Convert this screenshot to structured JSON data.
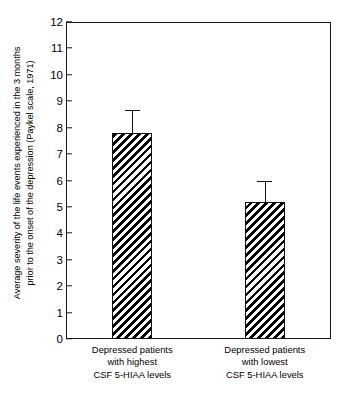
{
  "chart_data": {
    "type": "bar",
    "title": "",
    "subtitle": "",
    "xlabel": "",
    "ylabel_lines": [
      "Average severity of the life events experienced in the 3 months",
      "prior to the onset of the depression (Paykel scale, 1971)"
    ],
    "ylabel": "Average severity of the life events experienced in the 3 months prior to the onset of the depression (Paykel scale, 1971)",
    "categories": [
      "Depressed patients with highest CSF 5-HIAA levels",
      "Depressed patients with lowest CSF 5-HIAA levels"
    ],
    "category_lines": [
      [
        "Depressed patients",
        "with highest",
        "CSF 5-HIAA levels"
      ],
      [
        "Depressed patients",
        "with lowest",
        "CSF 5-HIAA levels"
      ]
    ],
    "values": [
      7.8,
      5.2
    ],
    "errors": [
      0.85,
      0.8
    ],
    "error_type": "upper-only",
    "ylim": [
      0,
      12
    ],
    "ytick_step": 1,
    "ytick_labels": [
      "12",
      "11",
      "10",
      "9",
      "8",
      "7",
      "6",
      "5",
      "4",
      "3",
      "2",
      "1",
      "0"
    ],
    "ytick_values": [
      12,
      11,
      10,
      9,
      8,
      7,
      6,
      5,
      4,
      3,
      2,
      1,
      0
    ],
    "grid": false,
    "legend": false,
    "legend_position": "none",
    "bar_fill": "diagonal-hatch",
    "bar_hatch_direction": "backslash",
    "colors": {
      "axis": "#1a1a1a",
      "bar_edge": "#111111",
      "bar_hatch": "#000000",
      "bar_background": "#ffffff",
      "error_bar": "#111111",
      "text": "#000000",
      "plot_background": "#ffffff"
    }
  }
}
